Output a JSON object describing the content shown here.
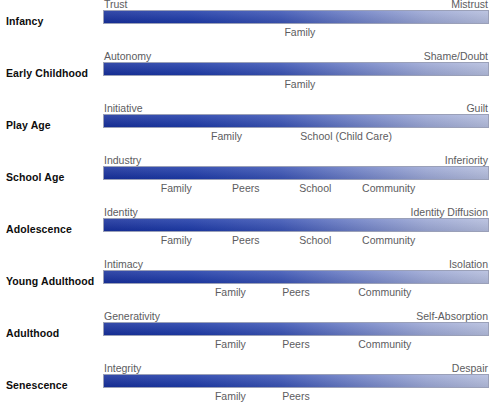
{
  "figure": {
    "kind": "erikson-psychosocial-stages-diagram",
    "bar_gradient": {
      "from": "#17309c",
      "to": "#b3bcdd"
    },
    "text_color": "#5c5c60",
    "label_color": "#0d0d0d"
  },
  "chart_data": {
    "type": "bar",
    "title": "",
    "xlabel": "",
    "ylabel": "",
    "categories": [
      "Infancy",
      "Early Childhood",
      "Play Age",
      "School Age",
      "Adolescence",
      "Young Adulthood",
      "Adulthood",
      "Senescence"
    ],
    "series": [
      {
        "name": "Syntonic (positive pole)",
        "values": [
          "Trust",
          "Autonomy",
          "Initiative",
          "Industry",
          "Identity",
          "Intimacy",
          "Generativity",
          "Integrity"
        ]
      },
      {
        "name": "Dystonic (negative pole)",
        "values": [
          "Mistrust",
          "Shame/Doubt",
          "Guilt",
          "Inferiority",
          "Identity Diffusion",
          "Isolation",
          "Self-Absorption",
          "Despair"
        ]
      }
    ],
    "annotations": [
      {
        "stage": "Infancy",
        "influences": [
          "Family"
        ]
      },
      {
        "stage": "Early Childhood",
        "influences": [
          "Family"
        ]
      },
      {
        "stage": "Play Age",
        "influences": [
          "Family",
          "School (Child Care)"
        ]
      },
      {
        "stage": "School Age",
        "influences": [
          "Family",
          "Peers",
          "School",
          "Community"
        ]
      },
      {
        "stage": "Adolescence",
        "influences": [
          "Family",
          "Peers",
          "School",
          "Community"
        ]
      },
      {
        "stage": "Young Adulthood",
        "influences": [
          "Family",
          "Peers",
          "Community"
        ]
      },
      {
        "stage": "Adulthood",
        "influences": [
          "Family",
          "Peers",
          "Community"
        ]
      },
      {
        "stage": "Senescence",
        "influences": [
          "Family",
          "Peers"
        ]
      }
    ],
    "grid": false,
    "legend": "none"
  },
  "rows": [
    {
      "stage": "Infancy",
      "left_pole": "Trust",
      "right_pole": "Mistrust",
      "influences": [
        {
          "text": "Family",
          "x_pct": 51
        }
      ]
    },
    {
      "stage": "Early Childhood",
      "left_pole": "Autonomy",
      "right_pole": "Shame/Doubt",
      "influences": [
        {
          "text": "Family",
          "x_pct": 51
        }
      ]
    },
    {
      "stage": "Play Age",
      "left_pole": "Initiative",
      "right_pole": "Guilt",
      "influences": [
        {
          "text": "Family",
          "x_pct": 32
        },
        {
          "text": "School (Child Care)",
          "x_pct": 63
        }
      ]
    },
    {
      "stage": "School Age",
      "left_pole": "Industry",
      "right_pole": "Inferiority",
      "influences": [
        {
          "text": "Family",
          "x_pct": 19
        },
        {
          "text": "Peers",
          "x_pct": 37
        },
        {
          "text": "School",
          "x_pct": 55
        },
        {
          "text": "Community",
          "x_pct": 74
        }
      ]
    },
    {
      "stage": "Adolescence",
      "left_pole": "Identity",
      "right_pole": "Identity Diffusion",
      "influences": [
        {
          "text": "Family",
          "x_pct": 19
        },
        {
          "text": "Peers",
          "x_pct": 37
        },
        {
          "text": "School",
          "x_pct": 55
        },
        {
          "text": "Community",
          "x_pct": 74
        }
      ]
    },
    {
      "stage": "Young Adulthood",
      "left_pole": "Intimacy",
      "right_pole": "Isolation",
      "influences": [
        {
          "text": "Family",
          "x_pct": 33
        },
        {
          "text": "Peers",
          "x_pct": 50
        },
        {
          "text": "Community",
          "x_pct": 73
        }
      ]
    },
    {
      "stage": "Adulthood",
      "left_pole": "Generativity",
      "right_pole": "Self-Absorption",
      "influences": [
        {
          "text": "Family",
          "x_pct": 33
        },
        {
          "text": "Peers",
          "x_pct": 50
        },
        {
          "text": "Community",
          "x_pct": 73
        }
      ]
    },
    {
      "stage": "Senescence",
      "left_pole": "Integrity",
      "right_pole": "Despair",
      "influences": [
        {
          "text": "Family",
          "x_pct": 33
        },
        {
          "text": "Peers",
          "x_pct": 50
        }
      ]
    }
  ]
}
